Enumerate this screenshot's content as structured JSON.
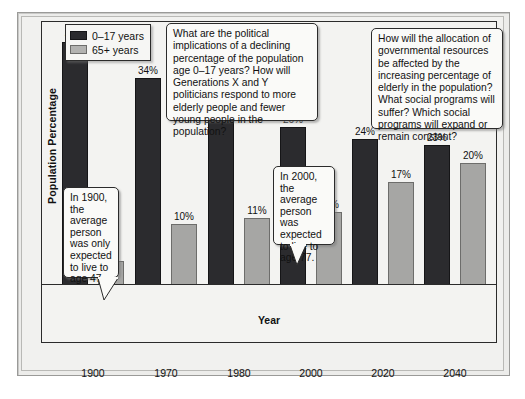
{
  "chart_data": {
    "type": "bar",
    "title": "",
    "xlabel": "Year",
    "ylabel": "Population Percentage",
    "categories": [
      "1900",
      "1970",
      "1980",
      "2000",
      "2020",
      "2040"
    ],
    "ylim": [
      0,
      40
    ],
    "grid": false,
    "legend_position": "top-left",
    "series": [
      {
        "name": "0–17 years",
        "color": "#2b2b2e",
        "values": [
          40,
          34,
          28,
          26,
          24,
          23
        ],
        "labels": [
          "40%",
          "34%",
          "28%",
          "26%",
          "24%",
          "23%"
        ]
      },
      {
        "name": "65+ years",
        "color": "#a6a6a4",
        "values": [
          4,
          10,
          11,
          12,
          17,
          20
        ],
        "labels": [
          "4%",
          "10%",
          "11%",
          "12%",
          "17%",
          "20%"
        ]
      }
    ],
    "annotations": [
      {
        "id": "politics",
        "text": "What are the political implications of a declining percentage of the population age 0–17 years? How will Generations X and Y politicians respond to more elderly people and fewer young people in the population?"
      },
      {
        "id": "resources",
        "text": "How will the allocation of governmental resources be affected by the increasing percentage of elderly in the population? What social programs will suffer? Which social programs will expand or remain constant?"
      },
      {
        "id": "life-1900",
        "text": "In 1900, the average person was only expected to live to age 47."
      },
      {
        "id": "life-2000",
        "text": "In 2000, the average person was expected to live to age 77."
      }
    ]
  },
  "legend": {
    "items": [
      {
        "label": "0–17 years",
        "swatch": "dark-swatch"
      },
      {
        "label": "65+ years",
        "swatch": "light-swatch"
      }
    ]
  },
  "axes": {
    "y_title": "Population Percentage",
    "x_title": "Year",
    "x_ticks": [
      "1900",
      "1970",
      "1980",
      "2000",
      "2020",
      "2040"
    ]
  },
  "bar_labels": {
    "g0s0": "40%",
    "g0s1": "4%",
    "g1s0": "34%",
    "g1s1": "10%",
    "g2s0": "28%",
    "g2s1": "11%",
    "g3s0": "26%",
    "g3s1": "12%",
    "g4s0": "24%",
    "g4s1": "17%",
    "g5s0": "23%",
    "g5s1": "20%"
  },
  "callouts": {
    "politics": "What are the political implications of a declining percentage of the population age 0–17 years? How will Generations X and Y politicians respond to more elderly people and fewer young people in the population?",
    "resources": "How will the allocation of governmental resources be affected by the increasing percentage of elderly in the population? What social programs will suffer? Which social programs will expand or remain constant?",
    "life1900": "In 1900, the average person was only expected to live to age 47.",
    "life2000": "In 2000, the average person was expected to live to age 77."
  },
  "colors": {
    "series_young": "#2b2b2e",
    "series_elderly": "#a6a6a4",
    "panel_background": "#f3f3f1",
    "frame": "#2b2b2b"
  }
}
